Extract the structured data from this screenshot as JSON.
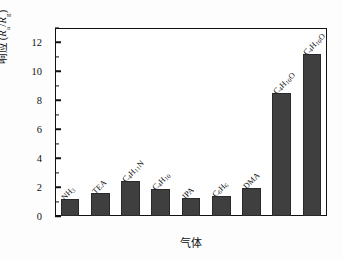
{
  "chart_data": {
    "type": "bar",
    "title": "",
    "xlabel": "气体",
    "ylabel": "响应 (Ra/Rg)",
    "categories": [
      "NH3",
      "TEA",
      "C4H11N",
      "C4H10",
      "IPA",
      "C6H6",
      "DMA",
      "C4H10O",
      "C4H10O"
    ],
    "category_labels_html": [
      "NH<sub>3</sub>",
      "TEA",
      "C<sub>4</sub>H<sub>11</sub>N",
      "C<sub>4</sub>H<sub>10</sub>",
      "IPA",
      "C<sub>6</sub>H<sub>6</sub>",
      "DMA",
      "C<sub>4</sub>H<sub>10</sub>O",
      "C<sub>4</sub>H<sub>10</sub>O"
    ],
    "values": [
      1.15,
      1.6,
      2.4,
      1.9,
      1.25,
      1.4,
      1.95,
      8.5,
      11.2
    ],
    "ylim": [
      0,
      13
    ],
    "yticks": [
      0,
      2,
      4,
      6,
      8,
      10,
      12
    ],
    "ytick_labels": [
      "0",
      "2",
      "4",
      "6",
      "8",
      "10",
      "12"
    ],
    "yminor_ticks": [
      1,
      3,
      5,
      7,
      9,
      11,
      13
    ],
    "grid": false,
    "legend": false,
    "bar_color": "#3f3f3f",
    "bar_edge_color": "#2a2a2a",
    "axis_color": "#111111",
    "background": "#ffffff"
  },
  "axes": {
    "y_title": "响应 (Ra/Rg)",
    "y_title_parts": {
      "text": "响应",
      "open_paren": "(",
      "numerator": "R",
      "num_sub": "a",
      "slash": "/",
      "denominator": "R",
      "den_sub": "g",
      "close_paren": ")"
    },
    "x_title": "气体"
  }
}
